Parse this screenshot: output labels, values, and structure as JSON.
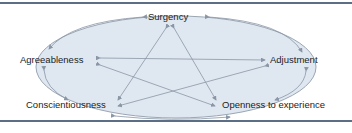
{
  "diagram": {
    "type": "pentagram-relationship-diagram",
    "colors": {
      "ellipse_fill": "#dfe8f1",
      "ellipse_stroke": "#9aa6b4",
      "arrow": "#8a96a6",
      "rule": "#5b6e86",
      "text": "#222222"
    },
    "nodes": [
      {
        "id": "surgency",
        "label": "Surgency"
      },
      {
        "id": "agreeableness",
        "label": "Agreeableness"
      },
      {
        "id": "adjustment",
        "label": "Adjustment"
      },
      {
        "id": "conscientiousness",
        "label": "Conscientiousness"
      },
      {
        "id": "openness",
        "label": "Openness to experience"
      }
    ],
    "edges": [
      {
        "from": "surgency",
        "to": "conscientiousness",
        "bidirectional": true
      },
      {
        "from": "surgency",
        "to": "openness",
        "bidirectional": true
      },
      {
        "from": "agreeableness",
        "to": "adjustment",
        "bidirectional": true
      },
      {
        "from": "agreeableness",
        "to": "openness",
        "bidirectional": true
      },
      {
        "from": "adjustment",
        "to": "conscientiousness",
        "bidirectional": true
      },
      {
        "from": "surgency",
        "to": "agreeableness",
        "bidirectional": true,
        "style": "ellipse-arc"
      },
      {
        "from": "surgency",
        "to": "adjustment",
        "bidirectional": true,
        "style": "ellipse-arc"
      },
      {
        "from": "agreeableness",
        "to": "conscientiousness",
        "bidirectional": true,
        "style": "ellipse-arc"
      },
      {
        "from": "adjustment",
        "to": "openness",
        "bidirectional": true,
        "style": "ellipse-arc"
      },
      {
        "from": "conscientiousness",
        "to": "openness",
        "bidirectional": true,
        "style": "ellipse-arc"
      }
    ]
  }
}
